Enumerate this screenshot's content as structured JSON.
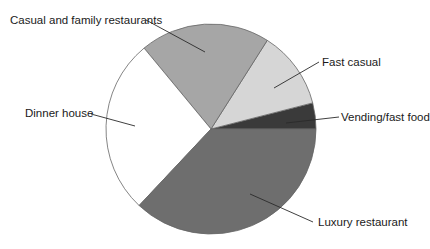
{
  "chart_data": {
    "type": "pie",
    "title": "",
    "categories": [
      "Vending/fast food",
      "Fast casual",
      "Casual and family restaurants",
      "Dinner house",
      "Luxury restaurant"
    ],
    "values": [
      4,
      12,
      20,
      27,
      37
    ],
    "units": "percent (estimated from slice angles, no data labels shown)",
    "colors": [
      "#3a3a3a",
      "#d6d6d6",
      "#a6a6a6",
      "#ffffff",
      "#6e6e6e"
    ],
    "start_angle_deg": 0,
    "direction": "counterclockwise",
    "legend": "none (leader-line labels)",
    "outline_color": "#666666"
  },
  "labels": {
    "vending": "Vending/fast food",
    "fast_casual": "Fast casual",
    "casual_family": "Casual and family restaurants",
    "dinner_house": "Dinner house",
    "luxury": "Luxury restaurant"
  }
}
